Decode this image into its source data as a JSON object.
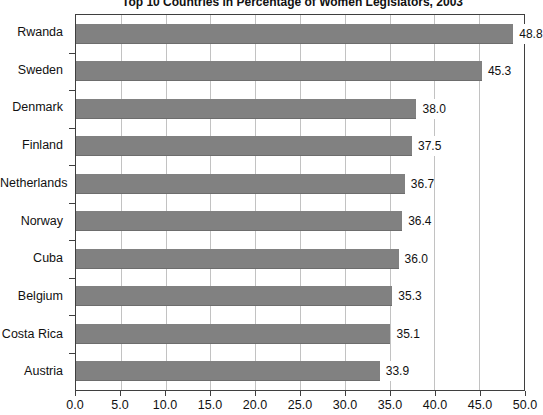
{
  "chart_data": {
    "type": "bar",
    "orientation": "horizontal",
    "title": "Top 10 Countries in Percentage of Women Legislators, 2003",
    "categories": [
      "Rwanda",
      "Sweden",
      "Denmark",
      "Finland",
      "Netherlands",
      "Norway",
      "Cuba",
      "Belgium",
      "Costa Rica",
      "Austria"
    ],
    "values": [
      48.8,
      45.3,
      38.0,
      37.5,
      36.7,
      36.4,
      36.0,
      35.3,
      35.1,
      33.9
    ],
    "value_labels": [
      "48.8",
      "45.3",
      "38.0",
      "37.5",
      "36.7",
      "36.4",
      "36.0",
      "35.3",
      "35.1",
      "33.9"
    ],
    "xlabel": "",
    "ylabel": "",
    "xlim": [
      0,
      50
    ],
    "x_ticks": [
      0,
      5,
      10,
      15,
      20,
      25,
      30,
      35,
      40,
      45,
      50
    ],
    "x_tick_labels": [
      "0.0",
      "5.0",
      "10.0",
      "15.0",
      "20.0",
      "25.0",
      "30.0",
      "35.0",
      "40.0",
      "45.0",
      "50.0"
    ],
    "grid": "vertical-lines-at-major-ticks",
    "legend_position": "none",
    "colors": {
      "bar": "#818181",
      "bar_edge": "#6d6d6d",
      "grid": "#c2c2c2",
      "border": "#3f3f3f",
      "text": "#111111",
      "background": "#ffffff"
    }
  }
}
